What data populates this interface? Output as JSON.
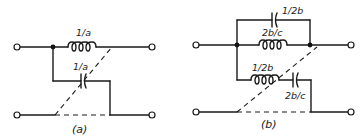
{
  "figure": {
    "panels": [
      {
        "id": "a",
        "caption": "(a)",
        "components": [
          {
            "type": "inductor",
            "label": "1/a",
            "position": "series-top"
          },
          {
            "type": "capacitor",
            "label": "1/a",
            "position": "cross-arm"
          }
        ]
      },
      {
        "id": "b",
        "caption": "(b)",
        "components": [
          {
            "type": "capacitor",
            "label": "1/2b",
            "position": "top-parallel"
          },
          {
            "type": "inductor",
            "label": "2b/c",
            "position": "series-top"
          },
          {
            "type": "inductor",
            "label": "1/2b",
            "position": "cross-arm"
          },
          {
            "type": "capacitor",
            "label": "2b/c",
            "position": "cross-arm"
          }
        ]
      }
    ]
  },
  "colors": {
    "ink": "#1a1a1a",
    "background": "#ffffff"
  }
}
